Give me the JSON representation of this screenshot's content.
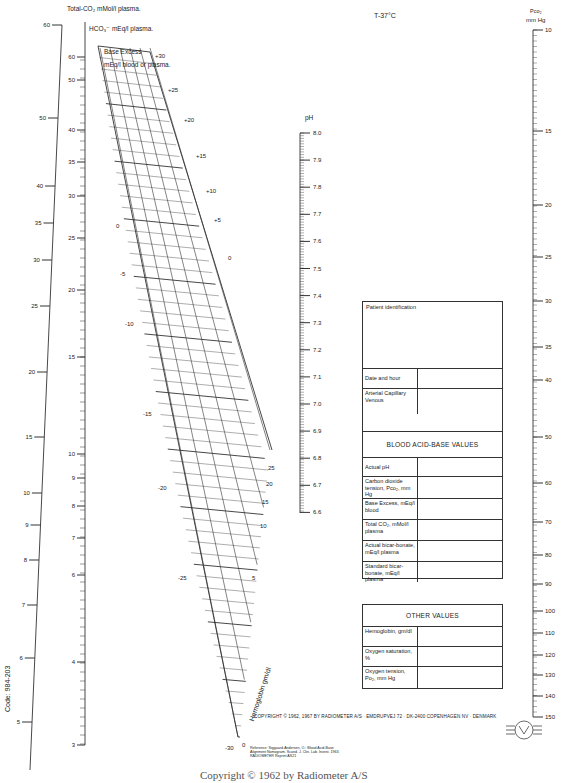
{
  "chart_data": {
    "type": "nomogram",
    "temperature": "T-37°C",
    "scales": [
      {
        "name": "Total-CO2",
        "label": "Total-CO₂ mMol/l plasma.",
        "ticks": [
          5,
          6,
          7,
          8,
          9,
          10,
          15,
          20,
          25,
          30,
          35,
          40,
          50,
          60
        ]
      },
      {
        "name": "HCO3",
        "label": "HCO₃⁻ mEq/l plasma.",
        "ticks": [
          3,
          4,
          6,
          7,
          8,
          9,
          10,
          15,
          20,
          25,
          30,
          35,
          40,
          50,
          60
        ]
      },
      {
        "name": "Base Excess",
        "label": "Base Excess mEq/l blood or plasma.",
        "ticks_right": [
          "+30",
          "+25",
          "+20",
          "+15",
          "+10",
          "+5",
          "0"
        ],
        "ticks_left": [
          "0",
          "-5",
          "-10",
          "-15",
          "-20",
          "-25",
          "-30"
        ]
      },
      {
        "name": "Hemoglobin",
        "label": "Hemoglobin gm/dl",
        "ticks": [
          "0",
          "5",
          "10",
          "15",
          "20",
          "25"
        ]
      },
      {
        "name": "pH",
        "label": "pH",
        "ticks": [
          "8.0",
          "7.9",
          "7.8",
          "7.7",
          "7.6",
          "7.5",
          "7.4",
          "7.3",
          "7.2",
          "7.1",
          "7.0",
          "6.9",
          "6.8",
          "6.7",
          "6.6"
        ]
      },
      {
        "name": "Pco2",
        "label": "Pco₂ mm Hg",
        "ticks": [
          "10",
          "15",
          "20",
          "25",
          "30",
          "35",
          "40",
          "50",
          "60",
          "70",
          "80",
          "90",
          "100",
          "110",
          "120",
          "130",
          "140",
          "150"
        ]
      }
    ]
  },
  "labels": {
    "total_co2": "Total-CO₂ mMol/l plasma.",
    "hco3": "HCO₃⁻ mEq/l plasma.",
    "base_excess_1": "Base Excess",
    "base_excess_2": "mEq/l blood or plasma.",
    "ph": "pH",
    "temp": "T-37°C",
    "pco2_1": "Pco₂",
    "pco2_2": "mm Hg",
    "hemoglobin": "Hemoglobin gm/dl"
  },
  "patient_form": {
    "title": "Patient identification",
    "rows": [
      {
        "label": "Date and hour"
      },
      {
        "label": "Arterial Capillary Venous"
      }
    ]
  },
  "acid_base_form": {
    "title": "BLOOD ACID-BASE VALUES",
    "rows": [
      {
        "label": "Actual pH"
      },
      {
        "label": "Carbon dioxide tension, Pco₂, mm Hg"
      },
      {
        "label": "Base Excess, mEq/l blood"
      },
      {
        "label": "Total CO₂, mMol/l plasma"
      },
      {
        "label": "Actual bicar-bonate, mEq/l plasma"
      },
      {
        "label": "Standard bicar-bonate, mEq/l plasma"
      }
    ]
  },
  "other_form": {
    "title": "OTHER VALUES",
    "rows": [
      {
        "label": "Hemoglobin, gm/dl"
      },
      {
        "label": "Oxygen saturation, %"
      },
      {
        "label": "Oxygen tension, Po₂, mm Hg"
      }
    ]
  },
  "footer": {
    "copyright": "COPYRIGHT © 1962, 1967 BY RADIOMETER A/S · EMDRUPVEJ 72 · DK-2400 COPENHAGEN NV · DENMARK",
    "reference_1": "Reference: Siggaard-Andersen, O.: Blood Acid-Base",
    "reference_2": "Alignment Nomogram. Scand. J. Clin. Lab. Invest. 1963.",
    "reference_3": "RADIOMETER Reprint AS21",
    "code": "Code: 984-203",
    "bottom_copyright": "Copyright © 1962 by Radiometer A/S"
  }
}
